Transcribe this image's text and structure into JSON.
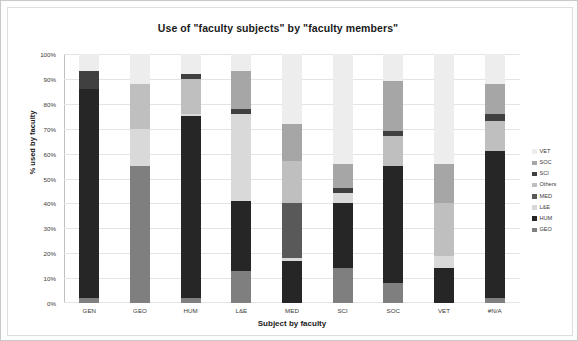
{
  "window": {
    "border_color": "#c9c9c9",
    "background": "#ffffff"
  },
  "chart_data": {
    "type": "bar",
    "subtype": "100% stacked column",
    "title": "Use of \"faculty subjects\" by \"faculty members\"",
    "xlabel": "Subject by faculty",
    "ylabel": "% used by faculty",
    "ylim": [
      0,
      100
    ],
    "yticks": [
      "0%",
      "10%",
      "20%",
      "30%",
      "40%",
      "50%",
      "60%",
      "70%",
      "80%",
      "90%",
      "100%"
    ],
    "grid": true,
    "legend_position": "right",
    "categories": [
      "GEN",
      "GEO",
      "HUM",
      "L&E",
      "MED",
      "SCI",
      "SOC",
      "VET",
      "#N/A"
    ],
    "series": [
      {
        "name": "GEO",
        "color": "#7f7f7f",
        "values": [
          2,
          55,
          2,
          13,
          0,
          14,
          8,
          0,
          2
        ]
      },
      {
        "name": "HUM",
        "color": "#262626",
        "values": [
          84,
          0,
          73,
          28,
          17,
          26,
          47,
          14,
          59
        ]
      },
      {
        "name": "L&E",
        "color": "#d9d9d9",
        "values": [
          0,
          15,
          1,
          35,
          1,
          4,
          0,
          5,
          0
        ]
      },
      {
        "name": "MED",
        "color": "#595959",
        "values": [
          0,
          0,
          0,
          0,
          22,
          0,
          0,
          0,
          0
        ]
      },
      {
        "name": "Others",
        "color": "#bfbfbf",
        "values": [
          0,
          18,
          14,
          0,
          17,
          0,
          12,
          21,
          12
        ]
      },
      {
        "name": "SCI",
        "color": "#404040",
        "values": [
          7,
          0,
          2,
          2,
          0,
          2,
          2,
          0,
          3
        ]
      },
      {
        "name": "SOC",
        "color": "#a6a6a6",
        "values": [
          0,
          0,
          0,
          15,
          15,
          10,
          20,
          16,
          12
        ]
      },
      {
        "name": "VET",
        "color": "#ededed",
        "values": [
          7,
          12,
          8,
          7,
          28,
          44,
          11,
          44,
          12
        ]
      }
    ],
    "legend_order": [
      "VET",
      "SOC",
      "SCI",
      "Others",
      "MED",
      "L&E",
      "HUM",
      "GEO"
    ],
    "stack_order": [
      "GEO",
      "HUM",
      "L&E",
      "MED",
      "Others",
      "SCI",
      "SOC",
      "VET"
    ]
  }
}
